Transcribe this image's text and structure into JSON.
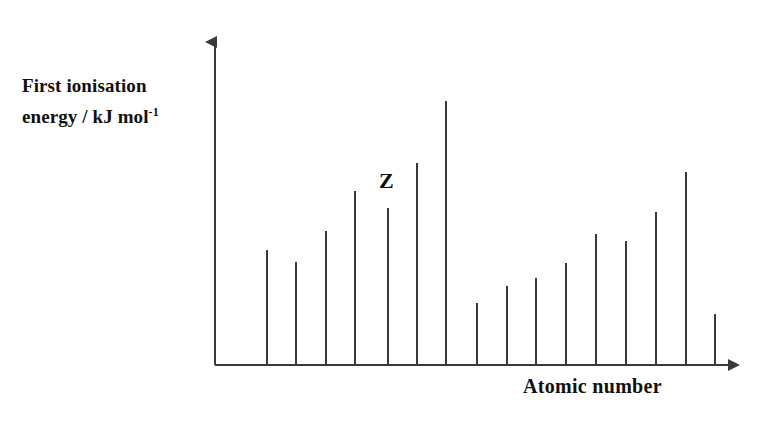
{
  "figure": {
    "background_color": "#ffffff",
    "ink_color": "#3a3a3a",
    "text_color": "#111111"
  },
  "labels": {
    "y_axis_line1": "First ionisation",
    "y_axis_line2_pre": "energy / kJ mol",
    "y_axis_superscript": "-1",
    "x_axis": "Atomic number",
    "annotation_z": "Z"
  },
  "chart_data": {
    "type": "bar",
    "title": "",
    "xlabel": "Atomic number",
    "ylabel": "First ionisation energy / kJ mol-1",
    "grid": false,
    "legend": false,
    "axis_arrows": true,
    "tick_labels_shown": false,
    "categories": [
      "1",
      "2",
      "3",
      "4",
      "5",
      "6",
      "7",
      "8",
      "9",
      "10",
      "11",
      "12",
      "13",
      "14",
      "15",
      "16"
    ],
    "values": [
      115,
      103,
      134,
      174,
      157,
      202,
      264,
      62,
      79,
      87,
      102,
      131,
      124,
      153,
      193,
      51
    ],
    "ylim": [
      0,
      280
    ],
    "annotations": [
      {
        "text": "Z",
        "category": "5",
        "position": "above-bar"
      }
    ]
  },
  "geometry": {
    "baseline_y": 365,
    "axis_x": 215,
    "bar_x_positions": [
      267,
      296,
      326,
      355,
      388,
      417,
      446,
      477,
      507,
      536,
      566,
      596,
      626,
      656,
      686,
      715
    ],
    "bar_top_y": [
      250,
      262,
      231,
      191,
      208,
      163,
      101,
      303,
      286,
      278,
      263,
      234,
      241,
      212,
      172,
      314
    ],
    "bar_width": 2,
    "y_axis_top": 30,
    "x_axis_end": 750
  }
}
